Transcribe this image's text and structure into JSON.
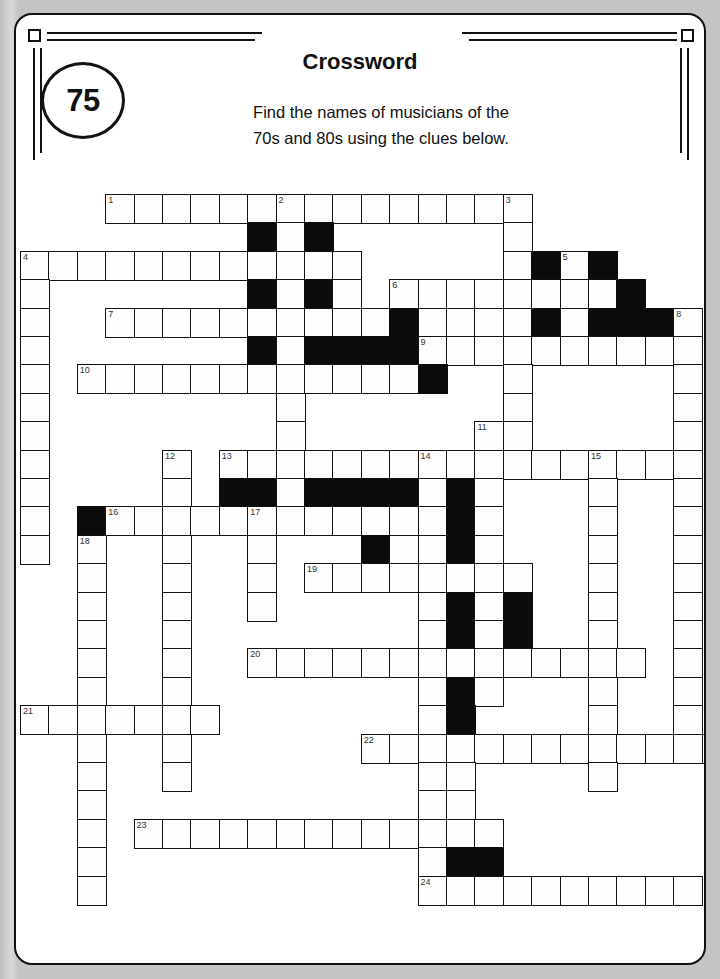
{
  "page": {
    "background_color": "#c9c9c9",
    "card_color": "#ffffff",
    "ink_color": "#111111"
  },
  "header": {
    "puzzle_number": "75",
    "title": "Crossword",
    "instruction_line_1": "Find the names of musicians of the",
    "instruction_line_2": "70s and 80s using the clues below."
  },
  "grid": {
    "origin_x": 4,
    "origin_y": 179,
    "cell_size": 28.4,
    "rows": 25,
    "cols": 25,
    "open_cell_color": "#fdfdfd",
    "block_cell_color": "#0b0b0b",
    "entries": [
      {
        "number": "1",
        "direction": "across",
        "row": 0,
        "col": 3,
        "length": 14
      },
      {
        "number": "2",
        "direction": "down",
        "row": 0,
        "col": 9,
        "length": 6
      },
      {
        "number": "3",
        "direction": "down",
        "row": 0,
        "col": 17,
        "length": 19
      },
      {
        "number": "4",
        "direction": "across",
        "row": 2,
        "col": 0,
        "length": 12
      },
      {
        "number": "4b",
        "direction": "down",
        "row": 2,
        "col": 0,
        "length": 9
      },
      {
        "number": "5",
        "direction": "down",
        "row": 2,
        "col": 19,
        "length": 4
      },
      {
        "number": "6",
        "direction": "across",
        "row": 3,
        "col": 13,
        "length": 9
      },
      {
        "number": "7",
        "direction": "across",
        "row": 4,
        "col": 3,
        "length": 11
      },
      {
        "number": "8",
        "direction": "down",
        "row": 4,
        "col": 23,
        "length": 8
      },
      {
        "number": "9",
        "direction": "across",
        "row": 5,
        "col": 14,
        "length": 6
      },
      {
        "number": "10",
        "direction": "across",
        "row": 6,
        "col": 2,
        "length": 13
      },
      {
        "number": "11",
        "direction": "down",
        "row": 8,
        "col": 16,
        "length": 4
      },
      {
        "number": "12",
        "direction": "down",
        "row": 9,
        "col": 5,
        "length": 13
      },
      {
        "number": "13",
        "direction": "across",
        "row": 9,
        "col": 7,
        "length": 17
      },
      {
        "number": "14",
        "direction": "down",
        "row": 9,
        "col": 14,
        "length": 7
      },
      {
        "number": "15",
        "direction": "down",
        "row": 9,
        "col": 20,
        "length": 12
      },
      {
        "number": "16",
        "direction": "across",
        "row": 11,
        "col": 3,
        "length": 14
      },
      {
        "number": "17",
        "direction": "down",
        "row": 11,
        "col": 8,
        "length": 6
      },
      {
        "number": "18",
        "direction": "down",
        "row": 12,
        "col": 2,
        "length": 13
      },
      {
        "number": "19",
        "direction": "across",
        "row": 13,
        "col": 10,
        "length": 8
      },
      {
        "number": "20",
        "direction": "across",
        "row": 16,
        "col": 8,
        "length": 14
      },
      {
        "number": "21",
        "direction": "across",
        "row": 18,
        "col": 0,
        "length": 7
      },
      {
        "number": "22",
        "direction": "across",
        "row": 19,
        "col": 12,
        "length": 13
      },
      {
        "number": "23",
        "direction": "across",
        "row": 22,
        "col": 4,
        "length": 13
      },
      {
        "number": "24",
        "direction": "across",
        "row": 24,
        "col": 14,
        "length": 10
      }
    ],
    "cells": [
      {
        "r": 0,
        "c": 3,
        "n": "1"
      },
      {
        "r": 0,
        "c": 4
      },
      {
        "r": 0,
        "c": 5
      },
      {
        "r": 0,
        "c": 6
      },
      {
        "r": 0,
        "c": 7
      },
      {
        "r": 0,
        "c": 8
      },
      {
        "r": 0,
        "c": 9,
        "n": "2"
      },
      {
        "r": 0,
        "c": 10
      },
      {
        "r": 0,
        "c": 11
      },
      {
        "r": 0,
        "c": 12
      },
      {
        "r": 0,
        "c": 13
      },
      {
        "r": 0,
        "c": 14
      },
      {
        "r": 0,
        "c": 15
      },
      {
        "r": 0,
        "c": 16
      },
      {
        "r": 0,
        "c": 17,
        "n": "3"
      },
      {
        "r": 1,
        "c": 8,
        "b": true
      },
      {
        "r": 1,
        "c": 9
      },
      {
        "r": 1,
        "c": 10,
        "b": true
      },
      {
        "r": 1,
        "c": 17
      },
      {
        "r": 2,
        "c": 0,
        "n": "4"
      },
      {
        "r": 2,
        "c": 1
      },
      {
        "r": 2,
        "c": 2
      },
      {
        "r": 2,
        "c": 3
      },
      {
        "r": 2,
        "c": 4
      },
      {
        "r": 2,
        "c": 5
      },
      {
        "r": 2,
        "c": 6
      },
      {
        "r": 2,
        "c": 7
      },
      {
        "r": 2,
        "c": 8
      },
      {
        "r": 2,
        "c": 9
      },
      {
        "r": 2,
        "c": 10
      },
      {
        "r": 2,
        "c": 11
      },
      {
        "r": 2,
        "c": 17
      },
      {
        "r": 2,
        "c": 18,
        "b": true
      },
      {
        "r": 2,
        "c": 19,
        "n": "5"
      },
      {
        "r": 2,
        "c": 20,
        "b": true
      },
      {
        "r": 3,
        "c": 0
      },
      {
        "r": 3,
        "c": 8,
        "b": true
      },
      {
        "r": 3,
        "c": 9
      },
      {
        "r": 3,
        "c": 10,
        "b": true
      },
      {
        "r": 3,
        "c": 11
      },
      {
        "r": 3,
        "c": 13,
        "n": "6"
      },
      {
        "r": 3,
        "c": 14
      },
      {
        "r": 3,
        "c": 15
      },
      {
        "r": 3,
        "c": 16
      },
      {
        "r": 3,
        "c": 17
      },
      {
        "r": 3,
        "c": 18
      },
      {
        "r": 3,
        "c": 19
      },
      {
        "r": 3,
        "c": 20
      },
      {
        "r": 3,
        "c": 21,
        "b": true
      },
      {
        "r": 4,
        "c": 0
      },
      {
        "r": 4,
        "c": 3,
        "n": "7"
      },
      {
        "r": 4,
        "c": 4
      },
      {
        "r": 4,
        "c": 5
      },
      {
        "r": 4,
        "c": 6
      },
      {
        "r": 4,
        "c": 7
      },
      {
        "r": 4,
        "c": 8
      },
      {
        "r": 4,
        "c": 9
      },
      {
        "r": 4,
        "c": 10
      },
      {
        "r": 4,
        "c": 11
      },
      {
        "r": 4,
        "c": 12
      },
      {
        "r": 4,
        "c": 13,
        "b": true
      },
      {
        "r": 4,
        "c": 14
      },
      {
        "r": 4,
        "c": 15
      },
      {
        "r": 4,
        "c": 16
      },
      {
        "r": 4,
        "c": 17
      },
      {
        "r": 4,
        "c": 18,
        "b": true
      },
      {
        "r": 4,
        "c": 19
      },
      {
        "r": 4,
        "c": 20,
        "b": true
      },
      {
        "r": 4,
        "c": 21,
        "b": true
      },
      {
        "r": 4,
        "c": 22,
        "b": true
      },
      {
        "r": 4,
        "c": 23,
        "n": "8"
      },
      {
        "r": 5,
        "c": 0
      },
      {
        "r": 5,
        "c": 8,
        "b": true
      },
      {
        "r": 5,
        "c": 9
      },
      {
        "r": 5,
        "c": 10,
        "b": true
      },
      {
        "r": 5,
        "c": 11,
        "b": true
      },
      {
        "r": 5,
        "c": 12,
        "b": true
      },
      {
        "r": 5,
        "c": 13,
        "b": true
      },
      {
        "r": 5,
        "c": 14,
        "n": "9"
      },
      {
        "r": 5,
        "c": 15
      },
      {
        "r": 5,
        "c": 16
      },
      {
        "r": 5,
        "c": 17
      },
      {
        "r": 5,
        "c": 18
      },
      {
        "r": 5,
        "c": 19
      },
      {
        "r": 5,
        "c": 20
      },
      {
        "r": 5,
        "c": 21
      },
      {
        "r": 5,
        "c": 22
      },
      {
        "r": 5,
        "c": 23
      },
      {
        "r": 6,
        "c": 0
      },
      {
        "r": 6,
        "c": 2,
        "n": "10"
      },
      {
        "r": 6,
        "c": 3
      },
      {
        "r": 6,
        "c": 4
      },
      {
        "r": 6,
        "c": 5
      },
      {
        "r": 6,
        "c": 6
      },
      {
        "r": 6,
        "c": 7
      },
      {
        "r": 6,
        "c": 8
      },
      {
        "r": 6,
        "c": 9
      },
      {
        "r": 6,
        "c": 10
      },
      {
        "r": 6,
        "c": 11
      },
      {
        "r": 6,
        "c": 12
      },
      {
        "r": 6,
        "c": 13
      },
      {
        "r": 6,
        "c": 14,
        "b": true
      },
      {
        "r": 6,
        "c": 17
      },
      {
        "r": 6,
        "c": 23
      },
      {
        "r": 7,
        "c": 0
      },
      {
        "r": 7,
        "c": 9
      },
      {
        "r": 7,
        "c": 17
      },
      {
        "r": 7,
        "c": 23
      },
      {
        "r": 8,
        "c": 0
      },
      {
        "r": 8,
        "c": 9
      },
      {
        "r": 8,
        "c": 16,
        "n": "11"
      },
      {
        "r": 8,
        "c": 17
      },
      {
        "r": 8,
        "c": 23
      },
      {
        "r": 9,
        "c": 0
      },
      {
        "r": 9,
        "c": 5,
        "n": "12"
      },
      {
        "r": 9,
        "c": 7,
        "n": "13"
      },
      {
        "r": 9,
        "c": 8
      },
      {
        "r": 9,
        "c": 9
      },
      {
        "r": 9,
        "c": 10
      },
      {
        "r": 9,
        "c": 11
      },
      {
        "r": 9,
        "c": 12
      },
      {
        "r": 9,
        "c": 13
      },
      {
        "r": 9,
        "c": 14,
        "n": "14"
      },
      {
        "r": 9,
        "c": 15
      },
      {
        "r": 9,
        "c": 16
      },
      {
        "r": 9,
        "c": 17
      },
      {
        "r": 9,
        "c": 18
      },
      {
        "r": 9,
        "c": 19
      },
      {
        "r": 9,
        "c": 20,
        "n": "15"
      },
      {
        "r": 9,
        "c": 21
      },
      {
        "r": 9,
        "c": 22
      },
      {
        "r": 9,
        "c": 23
      },
      {
        "r": 10,
        "c": 0
      },
      {
        "r": 10,
        "c": 5
      },
      {
        "r": 10,
        "c": 7,
        "b": true
      },
      {
        "r": 10,
        "c": 8,
        "b": true
      },
      {
        "r": 10,
        "c": 9
      },
      {
        "r": 10,
        "c": 10,
        "b": true
      },
      {
        "r": 10,
        "c": 11,
        "b": true
      },
      {
        "r": 10,
        "c": 12,
        "b": true
      },
      {
        "r": 10,
        "c": 13,
        "b": true
      },
      {
        "r": 10,
        "c": 14
      },
      {
        "r": 10,
        "c": 15,
        "b": true
      },
      {
        "r": 10,
        "c": 16
      },
      {
        "r": 10,
        "c": 20
      },
      {
        "r": 10,
        "c": 23
      },
      {
        "r": 11,
        "c": 0
      },
      {
        "r": 11,
        "c": 2,
        "b": true
      },
      {
        "r": 11,
        "c": 3,
        "n": "16"
      },
      {
        "r": 11,
        "c": 4
      },
      {
        "r": 11,
        "c": 5
      },
      {
        "r": 11,
        "c": 6
      },
      {
        "r": 11,
        "c": 7
      },
      {
        "r": 11,
        "c": 8,
        "n": "17"
      },
      {
        "r": 11,
        "c": 9
      },
      {
        "r": 11,
        "c": 10
      },
      {
        "r": 11,
        "c": 11
      },
      {
        "r": 11,
        "c": 12
      },
      {
        "r": 11,
        "c": 13
      },
      {
        "r": 11,
        "c": 14
      },
      {
        "r": 11,
        "c": 15,
        "b": true
      },
      {
        "r": 11,
        "c": 16
      },
      {
        "r": 11,
        "c": 20
      },
      {
        "r": 11,
        "c": 23
      },
      {
        "r": 12,
        "c": 0
      },
      {
        "r": 12,
        "c": 2,
        "n": "18"
      },
      {
        "r": 12,
        "c": 5
      },
      {
        "r": 12,
        "c": 8
      },
      {
        "r": 12,
        "c": 12,
        "b": true
      },
      {
        "r": 12,
        "c": 13
      },
      {
        "r": 12,
        "c": 14
      },
      {
        "r": 12,
        "c": 15,
        "b": true
      },
      {
        "r": 12,
        "c": 16
      },
      {
        "r": 12,
        "c": 20
      },
      {
        "r": 12,
        "c": 23
      },
      {
        "r": 13,
        "c": 2
      },
      {
        "r": 13,
        "c": 5
      },
      {
        "r": 13,
        "c": 8
      },
      {
        "r": 13,
        "c": 10,
        "n": "19"
      },
      {
        "r": 13,
        "c": 11
      },
      {
        "r": 13,
        "c": 12
      },
      {
        "r": 13,
        "c": 13
      },
      {
        "r": 13,
        "c": 14
      },
      {
        "r": 13,
        "c": 15
      },
      {
        "r": 13,
        "c": 16
      },
      {
        "r": 13,
        "c": 17
      },
      {
        "r": 13,
        "c": 20
      },
      {
        "r": 13,
        "c": 23
      },
      {
        "r": 14,
        "c": 2
      },
      {
        "r": 14,
        "c": 5
      },
      {
        "r": 14,
        "c": 8
      },
      {
        "r": 14,
        "c": 14
      },
      {
        "r": 14,
        "c": 15,
        "b": true
      },
      {
        "r": 14,
        "c": 16
      },
      {
        "r": 14,
        "c": 17,
        "b": true
      },
      {
        "r": 14,
        "c": 20
      },
      {
        "r": 14,
        "c": 23
      },
      {
        "r": 15,
        "c": 2
      },
      {
        "r": 15,
        "c": 5
      },
      {
        "r": 15,
        "c": 14
      },
      {
        "r": 15,
        "c": 15,
        "b": true
      },
      {
        "r": 15,
        "c": 16
      },
      {
        "r": 15,
        "c": 17,
        "b": true
      },
      {
        "r": 15,
        "c": 20
      },
      {
        "r": 15,
        "c": 23
      },
      {
        "r": 16,
        "c": 2
      },
      {
        "r": 16,
        "c": 5
      },
      {
        "r": 16,
        "c": 8,
        "n": "20"
      },
      {
        "r": 16,
        "c": 9
      },
      {
        "r": 16,
        "c": 10
      },
      {
        "r": 16,
        "c": 11
      },
      {
        "r": 16,
        "c": 12
      },
      {
        "r": 16,
        "c": 13
      },
      {
        "r": 16,
        "c": 14
      },
      {
        "r": 16,
        "c": 15
      },
      {
        "r": 16,
        "c": 16
      },
      {
        "r": 16,
        "c": 17
      },
      {
        "r": 16,
        "c": 18
      },
      {
        "r": 16,
        "c": 19
      },
      {
        "r": 16,
        "c": 20
      },
      {
        "r": 16,
        "c": 21
      },
      {
        "r": 16,
        "c": 23
      },
      {
        "r": 17,
        "c": 2
      },
      {
        "r": 17,
        "c": 5
      },
      {
        "r": 17,
        "c": 14
      },
      {
        "r": 17,
        "c": 15,
        "b": true
      },
      {
        "r": 17,
        "c": 16
      },
      {
        "r": 17,
        "c": 20
      },
      {
        "r": 17,
        "c": 23
      },
      {
        "r": 18,
        "c": 0,
        "n": "21"
      },
      {
        "r": 18,
        "c": 1
      },
      {
        "r": 18,
        "c": 2
      },
      {
        "r": 18,
        "c": 3
      },
      {
        "r": 18,
        "c": 4
      },
      {
        "r": 18,
        "c": 5
      },
      {
        "r": 18,
        "c": 6
      },
      {
        "r": 18,
        "c": 14
      },
      {
        "r": 18,
        "c": 15,
        "b": true
      },
      {
        "r": 18,
        "c": 20
      },
      {
        "r": 18,
        "c": 23
      },
      {
        "r": 19,
        "c": 2
      },
      {
        "r": 19,
        "c": 5
      },
      {
        "r": 19,
        "c": 12,
        "n": "22"
      },
      {
        "r": 19,
        "c": 13
      },
      {
        "r": 19,
        "c": 14
      },
      {
        "r": 19,
        "c": 15
      },
      {
        "r": 19,
        "c": 16
      },
      {
        "r": 19,
        "c": 17
      },
      {
        "r": 19,
        "c": 18
      },
      {
        "r": 19,
        "c": 19
      },
      {
        "r": 19,
        "c": 20
      },
      {
        "r": 19,
        "c": 21
      },
      {
        "r": 19,
        "c": 22
      },
      {
        "r": 19,
        "c": 23
      },
      {
        "r": 19,
        "c": 24
      },
      {
        "r": 20,
        "c": 2
      },
      {
        "r": 20,
        "c": 5
      },
      {
        "r": 20,
        "c": 14
      },
      {
        "r": 20,
        "c": 15
      },
      {
        "r": 20,
        "c": 20
      },
      {
        "r": 21,
        "c": 2
      },
      {
        "r": 21,
        "c": 14
      },
      {
        "r": 21,
        "c": 15
      },
      {
        "r": 22,
        "c": 2
      },
      {
        "r": 22,
        "c": 4,
        "n": "23"
      },
      {
        "r": 22,
        "c": 5
      },
      {
        "r": 22,
        "c": 6
      },
      {
        "r": 22,
        "c": 7
      },
      {
        "r": 22,
        "c": 8
      },
      {
        "r": 22,
        "c": 9
      },
      {
        "r": 22,
        "c": 10
      },
      {
        "r": 22,
        "c": 11
      },
      {
        "r": 22,
        "c": 12
      },
      {
        "r": 22,
        "c": 13
      },
      {
        "r": 22,
        "c": 14
      },
      {
        "r": 22,
        "c": 15
      },
      {
        "r": 22,
        "c": 16
      },
      {
        "r": 23,
        "c": 2
      },
      {
        "r": 23,
        "c": 14
      },
      {
        "r": 23,
        "c": 15,
        "b": true
      },
      {
        "r": 23,
        "c": 16,
        "b": true
      },
      {
        "r": 24,
        "c": 2
      },
      {
        "r": 24,
        "c": 14,
        "n": "24"
      },
      {
        "r": 24,
        "c": 15
      },
      {
        "r": 24,
        "c": 16
      },
      {
        "r": 24,
        "c": 17
      },
      {
        "r": 24,
        "c": 18
      },
      {
        "r": 24,
        "c": 19
      },
      {
        "r": 24,
        "c": 20
      },
      {
        "r": 24,
        "c": 21
      },
      {
        "r": 24,
        "c": 22
      },
      {
        "r": 24,
        "c": 23
      }
    ]
  }
}
